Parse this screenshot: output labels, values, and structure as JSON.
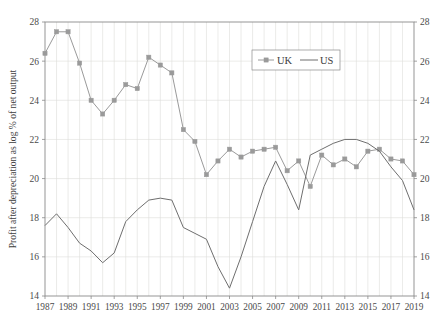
{
  "chart_data": {
    "type": "line",
    "title": "",
    "xlabel": "",
    "ylabel": "Profit after depreciation as log % of net output",
    "ylim": [
      14,
      28
    ],
    "ytick_values": [
      14,
      16,
      18,
      20,
      22,
      24,
      26,
      28
    ],
    "ytick_labels": [
      "14",
      "16",
      "18",
      "20",
      "22",
      "24",
      "26",
      "28"
    ],
    "right_axis_tick_labels": [
      "14",
      "16",
      "18",
      "20",
      "22",
      "24",
      "26",
      "28"
    ],
    "grid": true,
    "legend_position": "top-center-right",
    "x": [
      1987,
      1988,
      1989,
      1990,
      1991,
      1992,
      1993,
      1994,
      1995,
      1996,
      1997,
      1998,
      1999,
      2000,
      2001,
      2002,
      2003,
      2004,
      2005,
      2006,
      2007,
      2008,
      2009,
      2010,
      2011,
      2012,
      2013,
      2014,
      2015,
      2016,
      2017,
      2018,
      2019
    ],
    "xtick_labels": [
      "1987",
      "1989",
      "1991",
      "1993",
      "1995",
      "1997",
      "1999",
      "2001",
      "2003",
      "2005",
      "2007",
      "2009",
      "2011",
      "2013",
      "2015",
      "2017",
      "2019"
    ],
    "xtick_values": [
      1987,
      1989,
      1991,
      1993,
      1995,
      1997,
      1999,
      2001,
      2003,
      2005,
      2007,
      2009,
      2011,
      2013,
      2015,
      2017,
      2019
    ],
    "series": [
      {
        "name": "UK",
        "color": "#9a9a9a",
        "marker": "square",
        "values": [
          26.4,
          27.5,
          27.5,
          25.9,
          24.0,
          23.3,
          24.0,
          24.8,
          24.6,
          26.2,
          25.8,
          25.4,
          22.5,
          21.9,
          20.2,
          20.9,
          21.5,
          21.1,
          21.4,
          21.5,
          21.6,
          20.4,
          20.9,
          19.6,
          21.2,
          20.7,
          21.0,
          20.6,
          21.4,
          21.5,
          21.0,
          20.9,
          20.2
        ]
      },
      {
        "name": "US",
        "color": "#6e6e6e",
        "marker": "none",
        "values": [
          17.6,
          18.2,
          17.5,
          16.7,
          16.3,
          15.7,
          16.2,
          17.8,
          18.4,
          18.9,
          19.0,
          18.9,
          17.5,
          17.2,
          16.9,
          15.5,
          14.4,
          16.0,
          17.8,
          19.6,
          20.9,
          19.7,
          18.4,
          21.2,
          21.5,
          21.8,
          22.0,
          22.0,
          21.8,
          21.4,
          20.6,
          19.9,
          18.4
        ]
      }
    ]
  },
  "legend": {
    "items": [
      {
        "label": "UK",
        "marker": "square"
      },
      {
        "label": "US",
        "marker": "line"
      }
    ]
  },
  "caption": {
    "text": ""
  }
}
